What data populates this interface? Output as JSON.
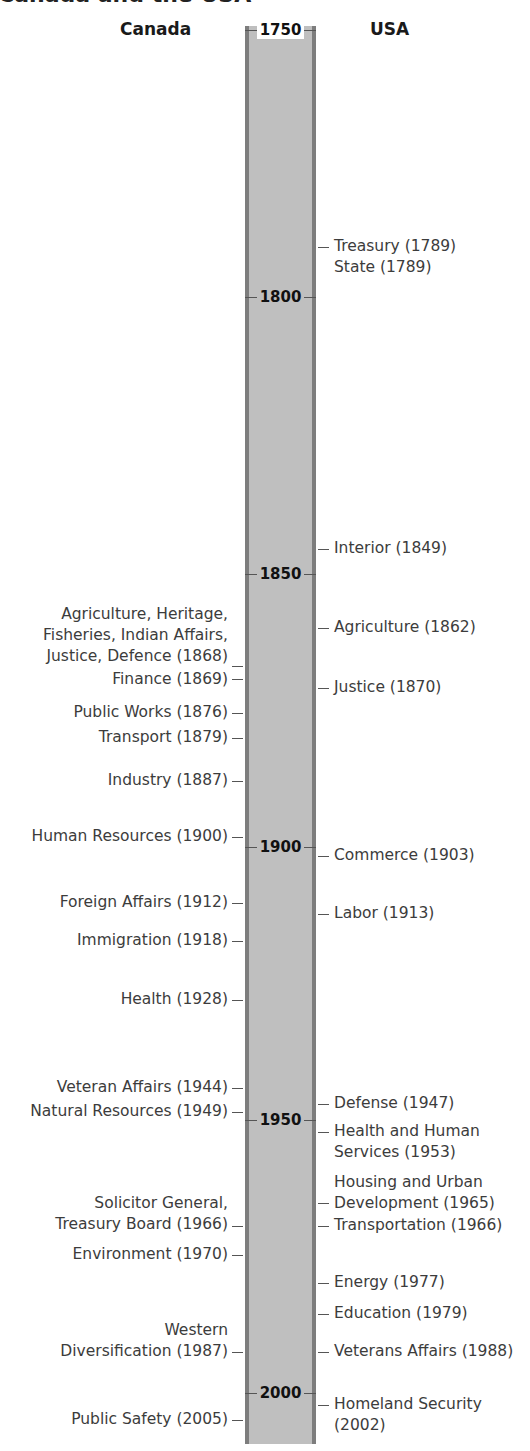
{
  "title": "Canada and the USA",
  "columns": {
    "left": "Canada",
    "right": "USA"
  },
  "axis": {
    "years": [
      {
        "label": "1750",
        "y": 30
      },
      {
        "label": "1800",
        "y": 297
      },
      {
        "label": "1850",
        "y": 574
      },
      {
        "label": "1900",
        "y": 847
      },
      {
        "label": "1950",
        "y": 1120
      },
      {
        "label": "2000",
        "y": 1393
      }
    ]
  },
  "canada": [
    {
      "lines": [
        "Agriculture, Heritage,",
        "Fisheries, Indian Affairs,",
        "Justice, Defence (1868)"
      ],
      "year": 1868,
      "top": 604,
      "tick": 666
    },
    {
      "lines": [
        "Finance (1869)"
      ],
      "year": 1869,
      "top": 669,
      "tick": 679
    },
    {
      "lines": [
        "Public Works (1876)"
      ],
      "year": 1876,
      "top": 702,
      "tick": 713
    },
    {
      "lines": [
        "Transport (1879)"
      ],
      "year": 1879,
      "top": 727,
      "tick": 738
    },
    {
      "lines": [
        "Industry (1887)"
      ],
      "year": 1887,
      "top": 770,
      "tick": 781
    },
    {
      "lines": [
        "Human Resources (1900)"
      ],
      "year": 1900,
      "top": 826,
      "tick": 837
    },
    {
      "lines": [
        "Foreign Affairs (1912)"
      ],
      "year": 1912,
      "top": 892,
      "tick": 903
    },
    {
      "lines": [
        "Immigration (1918)"
      ],
      "year": 1918,
      "top": 930,
      "tick": 941
    },
    {
      "lines": [
        "Health (1928)"
      ],
      "year": 1928,
      "top": 989,
      "tick": 1000
    },
    {
      "lines": [
        "Veteran Affairs (1944)"
      ],
      "year": 1944,
      "top": 1077,
      "tick": 1088
    },
    {
      "lines": [
        "Natural Resources (1949)"
      ],
      "year": 1949,
      "top": 1101,
      "tick": 1112
    },
    {
      "lines": [
        "Solicitor General,",
        "Treasury Board (1966)"
      ],
      "year": 1966,
      "top": 1193,
      "tick": 1226
    },
    {
      "lines": [
        "Environment (1970)"
      ],
      "year": 1970,
      "top": 1244,
      "tick": 1255
    },
    {
      "lines": [
        "Western",
        "Diversification (1987)"
      ],
      "year": 1987,
      "top": 1320,
      "tick": 1352
    },
    {
      "lines": [
        "Public Safety (2005)"
      ],
      "year": 2005,
      "top": 1409,
      "tick": 1420
    }
  ],
  "usa": [
    {
      "lines": [
        "Treasury (1789)",
        "State (1789)"
      ],
      "year": 1789,
      "top": 236,
      "tick": 247
    },
    {
      "lines": [
        "Interior (1849)"
      ],
      "year": 1849,
      "top": 538,
      "tick": 549
    },
    {
      "lines": [
        "Agriculture (1862)"
      ],
      "year": 1862,
      "top": 617,
      "tick": 628
    },
    {
      "lines": [
        "Justice (1870)"
      ],
      "year": 1870,
      "top": 677,
      "tick": 688
    },
    {
      "lines": [
        "Commerce (1903)"
      ],
      "year": 1903,
      "top": 845,
      "tick": 856
    },
    {
      "lines": [
        "Labor (1913)"
      ],
      "year": 1913,
      "top": 903,
      "tick": 914
    },
    {
      "lines": [
        "Defense (1947)"
      ],
      "year": 1947,
      "top": 1093,
      "tick": 1104
    },
    {
      "lines": [
        "Health and Human",
        "Services (1953)"
      ],
      "year": 1953,
      "top": 1121,
      "tick": 1132
    },
    {
      "lines": [
        "Housing and Urban",
        "Development (1965)"
      ],
      "year": 1965,
      "top": 1172,
      "tick": 1203
    },
    {
      "lines": [
        "Transportation (1966)"
      ],
      "year": 1966,
      "top": 1215,
      "tick": 1226
    },
    {
      "lines": [
        "Energy (1977)"
      ],
      "year": 1977,
      "top": 1272,
      "tick": 1283
    },
    {
      "lines": [
        "Education (1979)"
      ],
      "year": 1979,
      "top": 1303,
      "tick": 1314
    },
    {
      "lines": [
        "Veterans Affairs (1988)"
      ],
      "year": 1988,
      "top": 1341,
      "tick": 1352
    },
    {
      "lines": [
        "Homeland Security",
        "(2002)"
      ],
      "year": 2002,
      "top": 1394,
      "tick": 1405
    }
  ],
  "chart_data": {
    "type": "timeline",
    "title": "Canada and the USA",
    "xlabel": "",
    "ylabel": "Year",
    "ylim": [
      1750,
      2010
    ],
    "tick_labels": [
      "1750",
      "1800",
      "1850",
      "1900",
      "1950",
      "2000"
    ],
    "series": [
      {
        "name": "Canada",
        "events": [
          {
            "label": "Agriculture, Heritage, Fisheries, Indian Affairs, Justice, Defence",
            "year": 1868
          },
          {
            "label": "Finance",
            "year": 1869
          },
          {
            "label": "Public Works",
            "year": 1876
          },
          {
            "label": "Transport",
            "year": 1879
          },
          {
            "label": "Industry",
            "year": 1887
          },
          {
            "label": "Human Resources",
            "year": 1900
          },
          {
            "label": "Foreign Affairs",
            "year": 1912
          },
          {
            "label": "Immigration",
            "year": 1918
          },
          {
            "label": "Health",
            "year": 1928
          },
          {
            "label": "Veteran Affairs",
            "year": 1944
          },
          {
            "label": "Natural Resources",
            "year": 1949
          },
          {
            "label": "Solicitor General, Treasury Board",
            "year": 1966
          },
          {
            "label": "Environment",
            "year": 1970
          },
          {
            "label": "Western Diversification",
            "year": 1987
          },
          {
            "label": "Public Safety",
            "year": 2005
          }
        ]
      },
      {
        "name": "USA",
        "events": [
          {
            "label": "Treasury",
            "year": 1789
          },
          {
            "label": "State",
            "year": 1789
          },
          {
            "label": "Interior",
            "year": 1849
          },
          {
            "label": "Agriculture",
            "year": 1862
          },
          {
            "label": "Justice",
            "year": 1870
          },
          {
            "label": "Commerce",
            "year": 1903
          },
          {
            "label": "Labor",
            "year": 1913
          },
          {
            "label": "Defense",
            "year": 1947
          },
          {
            "label": "Health and Human Services",
            "year": 1953
          },
          {
            "label": "Housing and Urban Development",
            "year": 1965
          },
          {
            "label": "Transportation",
            "year": 1966
          },
          {
            "label": "Energy",
            "year": 1977
          },
          {
            "label": "Education",
            "year": 1979
          },
          {
            "label": "Veterans Affairs",
            "year": 1988
          },
          {
            "label": "Homeland Security",
            "year": 2002
          }
        ]
      }
    ],
    "colors": {
      "bar_fill": "#bfbfbf",
      "bar_border": "#7d7d7d",
      "text": "#3c3c3c"
    }
  }
}
